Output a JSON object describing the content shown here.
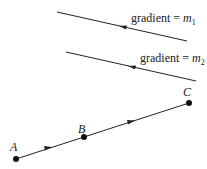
{
  "diagram": {
    "lines": [
      {
        "id": "line1",
        "label_text": "gradient = ",
        "label_var": "m",
        "label_sub": "1",
        "start": [
          57,
          12
        ],
        "end": [
          187,
          41
        ],
        "arrow_direction": "left"
      },
      {
        "id": "line2",
        "label_text": "gradient = ",
        "label_var": "m",
        "label_sub": "2",
        "start": [
          66,
          52
        ],
        "end": [
          196,
          81
        ],
        "arrow_direction": "left"
      }
    ],
    "points": [
      {
        "name": "A",
        "x": 16,
        "y": 159
      },
      {
        "name": "B",
        "x": 84,
        "y": 137
      },
      {
        "name": "C",
        "x": 189,
        "y": 103
      }
    ],
    "path_segments": [
      {
        "from": "A",
        "to": "B",
        "arrow_direction": "right"
      },
      {
        "from": "B",
        "to": "C",
        "arrow_direction": "right"
      }
    ],
    "colors": {
      "stroke": "#222222",
      "background": "#ffffff"
    }
  }
}
